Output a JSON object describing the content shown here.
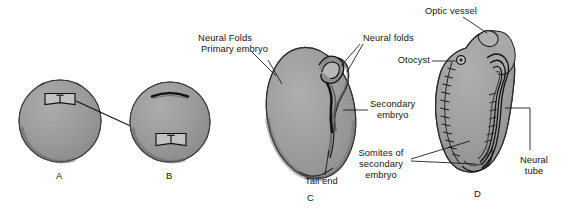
{
  "figure": {
    "background_color": "#ffffff",
    "ink_color": "#141414",
    "tissue_fill": "#9a9a9a",
    "tissue_shade": "#777777",
    "tissue_highlight": "#b4b4b4"
  },
  "panels": [
    {
      "id": "A",
      "letter": "A",
      "name": "donor-egg"
    },
    {
      "id": "B",
      "letter": "B",
      "name": "host-egg-graft"
    },
    {
      "id": "C",
      "letter": "C",
      "name": "embryo-neural-folds"
    },
    {
      "id": "D",
      "letter": "D",
      "name": "embryo-secondary"
    }
  ],
  "labels": {
    "neural_folds_primary": "Neural Folds",
    "primary_embryo": "Primary embryo",
    "neural_folds_secondary": "Neural folds",
    "secondary_embryo_line1": "Secondary",
    "secondary_embryo_line2": "embryo",
    "tail_end": "Tail end",
    "optic_vessel": "Optic vessel",
    "otocyst": "Otocyst",
    "somites_line1": "Somites of",
    "somites_line2": "secondary",
    "somites_line3": "embryo",
    "neural_tube_line1": "Neural",
    "neural_tube_line2": "tube"
  }
}
